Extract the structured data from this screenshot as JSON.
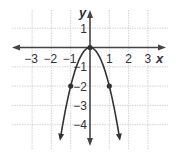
{
  "chart_data": {
    "type": "line",
    "title": "",
    "function": "y = -2x^2",
    "xlabel": "x",
    "ylabel": "y",
    "xlim": [
      -3.9,
      3.9
    ],
    "ylim": [
      -5.2,
      1.9
    ],
    "grid": true,
    "x_ticks": [
      -3,
      -2,
      -1,
      1,
      2,
      3
    ],
    "y_ticks": [
      1,
      -1,
      -2,
      -3,
      -4
    ],
    "x_tick_labels": [
      "−3",
      "−2",
      "−1",
      "1",
      "2",
      "3"
    ],
    "y_tick_labels": [
      "1",
      "−1",
      "−2",
      "−3",
      "−4"
    ],
    "series": [
      {
        "name": "parabola",
        "x": [
          -1.5,
          -1,
          -0.5,
          0,
          0.5,
          1,
          1.5
        ],
        "y": [
          -4.5,
          -2,
          -0.5,
          0,
          -0.5,
          -2,
          -4.5
        ]
      }
    ],
    "marked_points": [
      {
        "x": -1,
        "y": -2
      },
      {
        "x": 0,
        "y": 0
      },
      {
        "x": 1,
        "y": -2
      }
    ],
    "colors": {
      "curve": "#333333",
      "axes": "#444444",
      "grid": "#c8c8c8"
    }
  },
  "labels": {
    "x_axis": "x",
    "y_axis": "y"
  }
}
